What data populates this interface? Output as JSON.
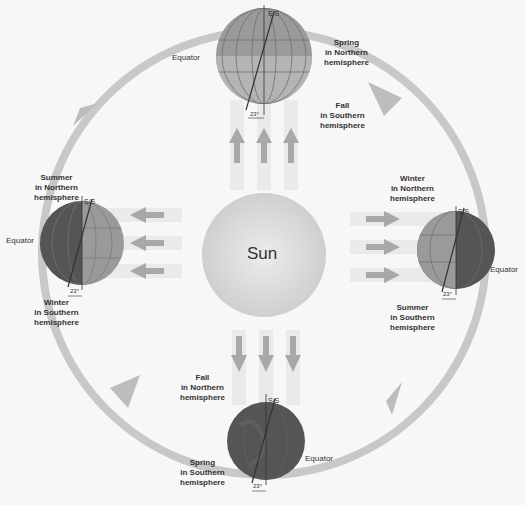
{
  "sun": {
    "label": "Sun"
  },
  "tilt_angle_label": "23°",
  "axis_marker_label": "S/S",
  "equator_label": "Equator",
  "positions": {
    "top": {
      "northern": [
        "Spring",
        "in Northern",
        "hemisphere"
      ],
      "southern": [
        "Fall",
        "in Southern",
        "hemisphere"
      ]
    },
    "left": {
      "northern": [
        "Summer",
        "in Northern",
        "hemisphere"
      ],
      "southern": [
        "Winter",
        "in Southern",
        "hemisphere"
      ]
    },
    "right": {
      "northern": [
        "Winter",
        "in Northern",
        "hemisphere"
      ],
      "southern": [
        "Summer",
        "in Southern",
        "hemisphere"
      ]
    },
    "bottom": {
      "northern": [
        "Fall",
        "in Northern",
        "hemisphere"
      ],
      "southern": [
        "Spring",
        "in Southern",
        "hemisphere"
      ]
    }
  },
  "colors": {
    "background": "#f7f7f7",
    "orbit": "#c8c8c8",
    "sun": "#d6d6d6",
    "globe_day": "#9a9a9a",
    "globe_night": "#555555",
    "sunlight_arrow": "#a8a8a8",
    "sunlight_beam": "#e6e6e6"
  }
}
